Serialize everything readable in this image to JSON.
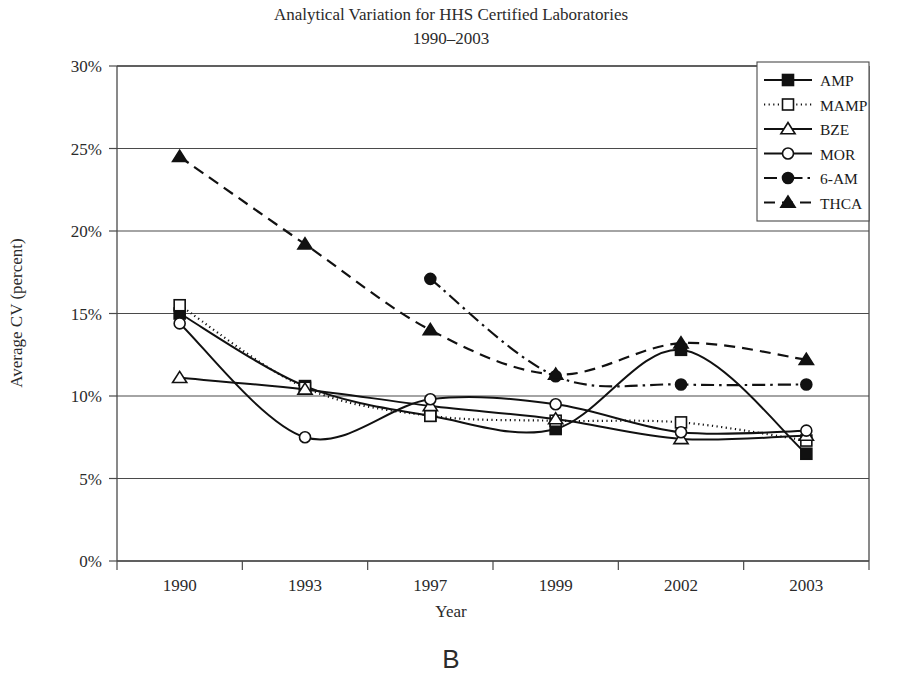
{
  "chart_data": {
    "type": "line",
    "title": "Analytical Variation for HHS Certified Laboratories",
    "subtitle": "1990–2003",
    "panel_label": "B",
    "xlabel": "Year",
    "ylabel": "Average CV (percent)",
    "categories": [
      "1990",
      "1993",
      "1997",
      "1999",
      "2002",
      "2003"
    ],
    "ylim": [
      0,
      30
    ],
    "ytick_values": [
      0,
      5,
      10,
      15,
      20,
      25,
      30
    ],
    "ytick_labels": [
      "0%",
      "5%",
      "10%",
      "15%",
      "20%",
      "25%",
      "30%"
    ],
    "grid": "horizontal",
    "legend_position": "top-right",
    "smoothing": "spline",
    "series": [
      {
        "name": "AMP",
        "marker": "filled-square",
        "linestyle": "solid",
        "color": "#111111",
        "values": [
          15.0,
          10.6,
          8.8,
          8.0,
          12.8,
          6.5
        ]
      },
      {
        "name": "MAMP",
        "marker": "open-square",
        "linestyle": "dotted",
        "color": "#111111",
        "values": [
          15.5,
          10.5,
          8.8,
          8.5,
          8.4,
          7.3
        ]
      },
      {
        "name": "BZE",
        "marker": "open-triangle",
        "linestyle": "solid",
        "color": "#111111",
        "values": [
          11.1,
          10.4,
          9.4,
          8.6,
          7.4,
          7.6
        ]
      },
      {
        "name": "MOR",
        "marker": "open-circle",
        "linestyle": "solid",
        "color": "#111111",
        "values": [
          14.4,
          7.5,
          9.8,
          9.5,
          7.8,
          7.9
        ]
      },
      {
        "name": "6-AM",
        "marker": "filled-circle",
        "linestyle": "dash-dot",
        "color": "#111111",
        "values": [
          null,
          null,
          17.1,
          11.2,
          10.7,
          10.7
        ]
      },
      {
        "name": "THCA",
        "marker": "filled-triangle",
        "linestyle": "dashed",
        "color": "#111111",
        "values": [
          24.5,
          19.2,
          14.0,
          11.3,
          13.2,
          12.2
        ]
      }
    ]
  }
}
